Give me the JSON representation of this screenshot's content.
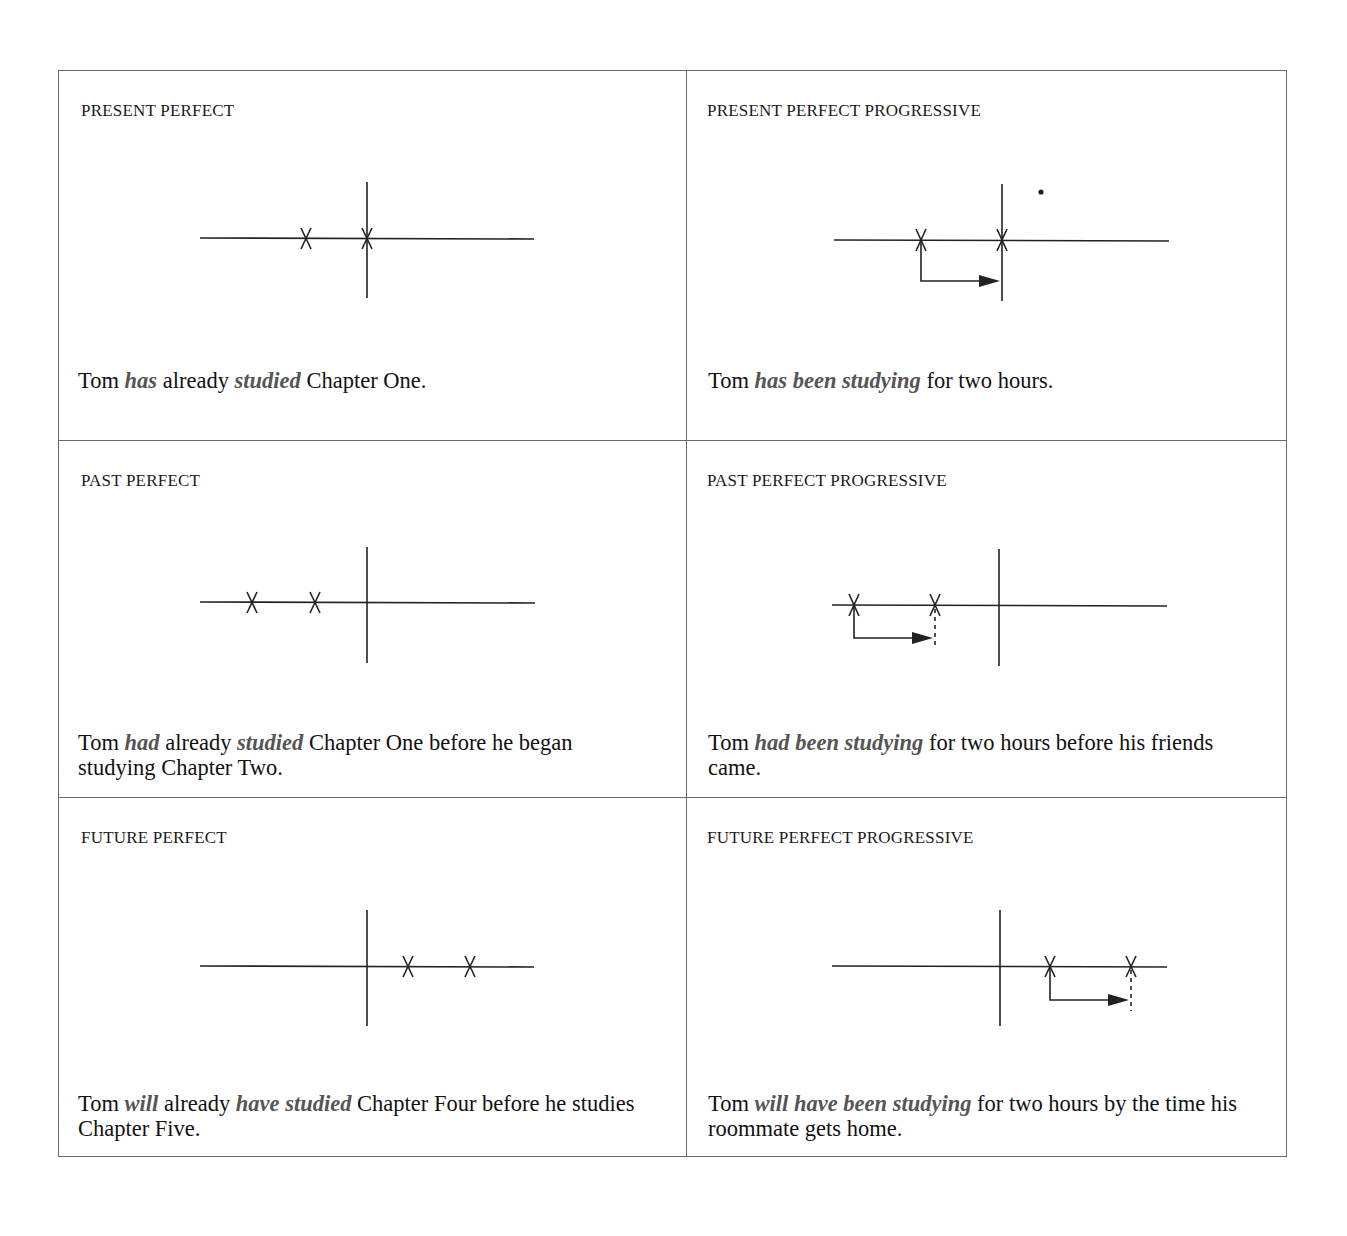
{
  "cells": [
    {
      "heading": "PRESENT PERFECT",
      "sentence": [
        {
          "text": "Tom ",
          "emph": false
        },
        {
          "text": "has",
          "emph": true
        },
        {
          "text": " already ",
          "emph": false
        },
        {
          "text": "studied",
          "emph": true
        },
        {
          "text": " Chapter One.",
          "emph": false
        }
      ]
    },
    {
      "heading": "PRESENT PERFECT PROGRESSIVE",
      "sentence": [
        {
          "text": "Tom ",
          "emph": false
        },
        {
          "text": "has been studying",
          "emph": true
        },
        {
          "text": " for two hours.",
          "emph": false
        }
      ]
    },
    {
      "heading": "PAST PERFECT",
      "sentence": [
        {
          "text": "Tom ",
          "emph": false
        },
        {
          "text": "had",
          "emph": true
        },
        {
          "text": " already ",
          "emph": false
        },
        {
          "text": "studied",
          "emph": true
        },
        {
          "text": " Chapter One before he began studying Chapter Two.",
          "emph": false
        }
      ]
    },
    {
      "heading": "PAST PERFECT PROGRESSIVE",
      "sentence": [
        {
          "text": "Tom ",
          "emph": false
        },
        {
          "text": "had been studying",
          "emph": true
        },
        {
          "text": " for two hours before his friends came.",
          "emph": false
        }
      ]
    },
    {
      "heading": "FUTURE PERFECT",
      "sentence": [
        {
          "text": "Tom ",
          "emph": false
        },
        {
          "text": "will",
          "emph": true
        },
        {
          "text": " already ",
          "emph": false
        },
        {
          "text": "have studied",
          "emph": true
        },
        {
          "text": " Chapter Four before he studies Chapter Five.",
          "emph": false
        }
      ]
    },
    {
      "heading": "FUTURE PERFECT PROGRESSIVE",
      "sentence": [
        {
          "text": "Tom ",
          "emph": false
        },
        {
          "text": "will have been studying",
          "emph": true
        },
        {
          "text": " for two hours by the time his roommate gets home.",
          "emph": false
        }
      ]
    }
  ],
  "colors": {
    "border": "#6a6a6a",
    "text": "#111111",
    "emphasis": "#555555",
    "diagram_line": "#222222"
  }
}
